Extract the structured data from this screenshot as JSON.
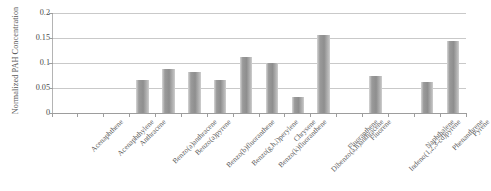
{
  "chart_data": {
    "type": "bar",
    "title": "",
    "xlabel": "",
    "ylabel": "Normalized PAH Concentration",
    "ylim": [
      0,
      0.2
    ],
    "ytick_labels": [
      "0.2",
      "0.15",
      "0.1",
      "0.05",
      "0"
    ],
    "ytick_values": [
      0.2,
      0.15,
      0.1,
      0.05,
      0
    ],
    "grid": true,
    "legend": "none",
    "categories": [
      "Acenaphthene",
      "Acenaphthylene",
      "Anthracene",
      "Benzo(a)anthracene",
      "Benzo(a)pyrene",
      "Benzo(b)fluoranthene",
      "Benzo(g,h,i)perylene",
      "Benzo(k)fluoranthene",
      "Chrysene",
      "Dibenzo(a,h)anthracene",
      "Fluoranthene",
      "Fluorene",
      "Indeno(1,2,3-cd)pyrene",
      "Naphthalene",
      "Phenanthrene",
      "Pyrene"
    ],
    "values": [
      0,
      0,
      0,
      0.067,
      0.089,
      0.082,
      0.067,
      0.112,
      0.1,
      0.033,
      0.157,
      0,
      0.074,
      0,
      0.062,
      0.145
    ],
    "bar_color": "#9a9a9a",
    "gridline_color": "#c9c9c9",
    "axis_color": "#9d9d9d"
  }
}
